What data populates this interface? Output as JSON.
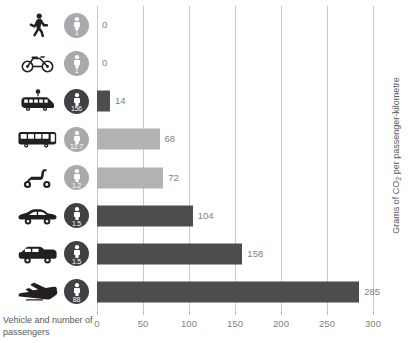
{
  "chart_data": {
    "type": "bar",
    "orientation": "horizontal",
    "title": "",
    "xlabel": "Vehicle and number of passengers",
    "ylabel": "Grams of CO2 per passenger-kilometre",
    "ylabel_prefix": "Grams of CO",
    "ylabel_sub": "2",
    "ylabel_suffix": " per passenger-kilometre",
    "xlim": [
      0,
      300
    ],
    "xticks": [
      0,
      50,
      100,
      150,
      200,
      250,
      300
    ],
    "xtick_labels": [
      "0",
      "50",
      "100",
      "150",
      "200",
      "250",
      "300"
    ],
    "grid": true,
    "legend": "none",
    "colors": {
      "bar_light": "#b2b2b2",
      "bar_dark": "#4d4d4d",
      "badge_light": "#a7a9ac",
      "badge_dark": "#414042",
      "gridline": "#c9c9c9",
      "text": "#58595b",
      "value_text": "#808285"
    },
    "categories": [
      "Walking",
      "Bicycle",
      "Tram",
      "Bus",
      "Scooter",
      "Car",
      "SUV",
      "Airplane"
    ],
    "values": [
      0,
      0,
      14,
      68,
      72,
      104,
      158,
      285
    ],
    "passengers": [
      "1",
      "1",
      "156",
      "12.7",
      "1.2",
      "1.5",
      "1.5",
      "88"
    ],
    "rows": [
      {
        "icon": "pedestrian-icon",
        "passengers": "1",
        "value": 0,
        "value_label": "0",
        "shade": "light"
      },
      {
        "icon": "bicycle-icon",
        "passengers": "1",
        "value": 0,
        "value_label": "0",
        "shade": "light"
      },
      {
        "icon": "tram-icon",
        "passengers": "156",
        "value": 14,
        "value_label": "14",
        "shade": "dark"
      },
      {
        "icon": "bus-icon",
        "passengers": "12.7",
        "value": 68,
        "value_label": "68",
        "shade": "light"
      },
      {
        "icon": "scooter-icon",
        "passengers": "1.2",
        "value": 72,
        "value_label": "72",
        "shade": "light"
      },
      {
        "icon": "car-icon",
        "passengers": "1.5",
        "value": 104,
        "value_label": "104",
        "shade": "dark"
      },
      {
        "icon": "suv-icon",
        "passengers": "1.5",
        "value": 158,
        "value_label": "158",
        "shade": "dark"
      },
      {
        "icon": "airplane-icon",
        "passengers": "88",
        "value": 285,
        "value_label": "285",
        "shade": "dark"
      }
    ]
  }
}
